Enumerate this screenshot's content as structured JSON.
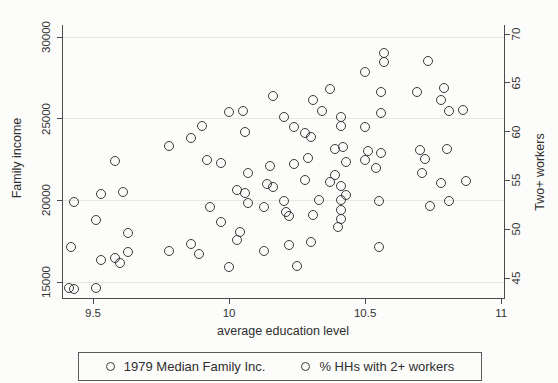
{
  "figure": {
    "background": "#fcfcfa",
    "axis_color": "#4a4a4a",
    "grid_color": "#e7e7e2",
    "marker_color": "#3a3a3a"
  },
  "chart_data": {
    "type": "scatter",
    "title": "",
    "x_axis": {
      "label": "average education level",
      "min": 9.386,
      "max": 11.014,
      "ticks": [
        9.5,
        10,
        10.5,
        11
      ],
      "tick_labels": [
        "9.5",
        "10",
        "10.5",
        "11"
      ]
    },
    "y_axis_left": {
      "label": "Family income",
      "min": 13960,
      "max": 30735,
      "ticks": [
        15000,
        20000,
        25000,
        30000
      ],
      "tick_labels": [
        "15000",
        "20000",
        "25000",
        "30000"
      ],
      "grid": true
    },
    "y_axis_right": {
      "label": "Two+ workers",
      "min": 42.85,
      "max": 70.93,
      "ticks": [
        45,
        50,
        55,
        60,
        65,
        70
      ],
      "tick_labels": [
        "45",
        "50",
        "55",
        "60",
        "65",
        "70"
      ],
      "grid": false
    },
    "legend": {
      "position": "bottom",
      "entries": [
        "1979 Median Family Inc.",
        "% HHs with 2+ workers"
      ]
    },
    "series": [
      {
        "name": "1979 Median Family Inc.",
        "axis": "left",
        "marker": "hollow-circle",
        "points": [
          {
            "x": 9.78,
            "y": 23300
          },
          {
            "x": 9.9,
            "y": 24550
          },
          {
            "x": 10.05,
            "y": 25500
          },
          {
            "x": 10.16,
            "y": 26400
          },
          {
            "x": 10.24,
            "y": 24500
          },
          {
            "x": 10.3,
            "y": 23900
          },
          {
            "x": 10.34,
            "y": 25450
          },
          {
            "x": 10.41,
            "y": 25100
          },
          {
            "x": 10.39,
            "y": 23150
          },
          {
            "x": 10.29,
            "y": 22600
          },
          {
            "x": 10.5,
            "y": 24500
          },
          {
            "x": 10.57,
            "y": 28450
          },
          {
            "x": 10.56,
            "y": 26650
          },
          {
            "x": 10.79,
            "y": 26900
          },
          {
            "x": 10.81,
            "y": 25500
          },
          {
            "x": 10.56,
            "y": 25350
          },
          {
            "x": 10.56,
            "y": 22900
          },
          {
            "x": 10.54,
            "y": 21950
          },
          {
            "x": 10.72,
            "y": 22550
          },
          {
            "x": 10.71,
            "y": 21650
          },
          {
            "x": 10.87,
            "y": 21200
          },
          {
            "x": 10.74,
            "y": 19650
          },
          {
            "x": 10.55,
            "y": 17150
          },
          {
            "x": 10.07,
            "y": 21650
          },
          {
            "x": 10.24,
            "y": 22200
          },
          {
            "x": 10.03,
            "y": 20650
          },
          {
            "x": 10.14,
            "y": 21000
          },
          {
            "x": 10.07,
            "y": 19850
          },
          {
            "x": 10.2,
            "y": 19950
          },
          {
            "x": 10.22,
            "y": 19050
          },
          {
            "x": 10.33,
            "y": 20050
          },
          {
            "x": 10.37,
            "y": 21150
          },
          {
            "x": 10.41,
            "y": 20850
          },
          {
            "x": 10.43,
            "y": 20300
          },
          {
            "x": 10.41,
            "y": 18850
          },
          {
            "x": 9.97,
            "y": 18700
          },
          {
            "x": 10.04,
            "y": 18050
          },
          {
            "x": 10.3,
            "y": 17450
          },
          {
            "x": 10.25,
            "y": 16000
          },
          {
            "x": 9.58,
            "y": 22400
          },
          {
            "x": 9.53,
            "y": 20400
          },
          {
            "x": 9.51,
            "y": 18800
          },
          {
            "x": 9.42,
            "y": 17150
          },
          {
            "x": 9.58,
            "y": 16450
          },
          {
            "x": 9.63,
            "y": 16850
          },
          {
            "x": 9.86,
            "y": 17350
          },
          {
            "x": 9.41,
            "y": 14650
          },
          {
            "x": 9.51,
            "y": 14650
          },
          {
            "x": 9.93,
            "y": 19600
          }
        ]
      },
      {
        "name": "% HHs with 2+ workers",
        "axis": "right",
        "marker": "hollow-circle",
        "points": [
          {
            "x": 9.86,
            "y": 59.4
          },
          {
            "x": 10.0,
            "y": 62.0
          },
          {
            "x": 10.06,
            "y": 60.0
          },
          {
            "x": 10.2,
            "y": 61.5
          },
          {
            "x": 10.28,
            "y": 59.9
          },
          {
            "x": 10.31,
            "y": 63.2
          },
          {
            "x": 10.37,
            "y": 64.4
          },
          {
            "x": 10.41,
            "y": 60.6
          },
          {
            "x": 10.42,
            "y": 58.4
          },
          {
            "x": 10.5,
            "y": 66.1
          },
          {
            "x": 10.57,
            "y": 68.1
          },
          {
            "x": 10.73,
            "y": 67.2
          },
          {
            "x": 10.69,
            "y": 64.1
          },
          {
            "x": 10.78,
            "y": 63.2
          },
          {
            "x": 10.86,
            "y": 62.2
          },
          {
            "x": 10.51,
            "y": 58.0
          },
          {
            "x": 10.5,
            "y": 57.1
          },
          {
            "x": 10.7,
            "y": 58.1
          },
          {
            "x": 10.8,
            "y": 58.2
          },
          {
            "x": 10.78,
            "y": 54.7
          },
          {
            "x": 10.55,
            "y": 52.9
          },
          {
            "x": 10.81,
            "y": 52.9
          },
          {
            "x": 9.97,
            "y": 56.8
          },
          {
            "x": 10.15,
            "y": 56.5
          },
          {
            "x": 10.43,
            "y": 56.9
          },
          {
            "x": 10.06,
            "y": 53.7
          },
          {
            "x": 10.16,
            "y": 54.3
          },
          {
            "x": 10.13,
            "y": 52.3
          },
          {
            "x": 10.21,
            "y": 51.8
          },
          {
            "x": 10.28,
            "y": 55.0
          },
          {
            "x": 10.31,
            "y": 51.5
          },
          {
            "x": 10.39,
            "y": 55.6
          },
          {
            "x": 10.41,
            "y": 53.0
          },
          {
            "x": 10.41,
            "y": 52.0
          },
          {
            "x": 10.4,
            "y": 50.2
          },
          {
            "x": 10.03,
            "y": 48.9
          },
          {
            "x": 10.22,
            "y": 48.4
          },
          {
            "x": 10.13,
            "y": 47.8
          },
          {
            "x": 10.0,
            "y": 46.1
          },
          {
            "x": 9.43,
            "y": 52.8
          },
          {
            "x": 9.61,
            "y": 53.8
          },
          {
            "x": 9.63,
            "y": 49.6
          },
          {
            "x": 9.53,
            "y": 46.8
          },
          {
            "x": 9.6,
            "y": 46.5
          },
          {
            "x": 9.78,
            "y": 47.8
          },
          {
            "x": 9.89,
            "y": 47.5
          },
          {
            "x": 9.43,
            "y": 43.9
          },
          {
            "x": 9.92,
            "y": 57.1
          }
        ]
      }
    ]
  }
}
